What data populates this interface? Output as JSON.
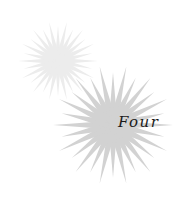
{
  "title_word": "Four",
  "decoration": {
    "small_burst": {
      "icon": "starburst-icon",
      "cx": 58,
      "cy": 61,
      "radius": 40,
      "rays": 28,
      "color": "#ececec"
    },
    "large_burst": {
      "icon": "starburst-icon",
      "cx": 113,
      "cy": 125,
      "radius": 60,
      "rays": 28,
      "color": "#d2d2d2"
    }
  },
  "colors": {
    "text": "#1a1a1a",
    "background": "#ffffff"
  }
}
